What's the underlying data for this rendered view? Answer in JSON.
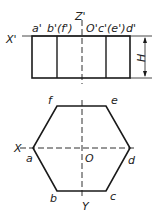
{
  "front_view": {
    "axis_x_label": "X'",
    "axis_z_label": "Z'",
    "top_labels": [
      {
        "id": "a",
        "text": "a'"
      },
      {
        "id": "bf",
        "text": "b'(f')"
      },
      {
        "id": "o",
        "text": "O'"
      },
      {
        "id": "ce",
        "text": "c'(e')"
      },
      {
        "id": "d",
        "text": "d'"
      }
    ],
    "dimension_label": "H"
  },
  "top_view": {
    "axis_x_label": "X",
    "axis_y_label": "Y",
    "origin_label": "O",
    "vertices": [
      {
        "id": "a",
        "text": "a"
      },
      {
        "id": "b",
        "text": "b"
      },
      {
        "id": "c",
        "text": "c"
      },
      {
        "id": "d",
        "text": "d"
      },
      {
        "id": "e",
        "text": "e"
      },
      {
        "id": "f",
        "text": "f"
      }
    ]
  },
  "colors": {
    "line": "#1a1a1a",
    "text": "#222222"
  }
}
